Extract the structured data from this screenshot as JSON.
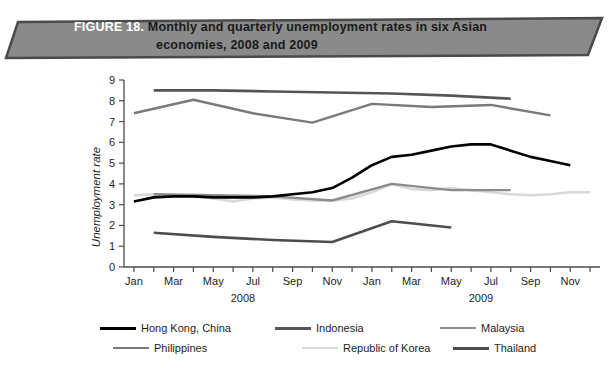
{
  "banner": {
    "figure_label": "FIGURE 18.",
    "title_line1": "Monthly and quarterly unemployment rates in six Asian",
    "title_line2": "economies, 2008 and 2009",
    "fill_color": "#8a8a8a",
    "border_color": "#4a4a4a",
    "label_color": "#ffffff",
    "title_color": "#1a1a1a"
  },
  "chart_data": {
    "type": "line",
    "title": "Monthly and quarterly unemployment rates in six Asian economies, 2008 and 2009",
    "xlabel": "",
    "ylabel": "Unemployment rate",
    "ylim": [
      0,
      9
    ],
    "yticks": [
      0,
      1,
      2,
      3,
      4,
      5,
      6,
      7,
      8,
      9
    ],
    "ytick_labels": [
      "0",
      "1",
      "2",
      "3",
      "4",
      "5",
      "6",
      "7",
      "8",
      "9"
    ],
    "grid": false,
    "legend_position": "below",
    "x": [
      "Jan 2008",
      "Feb 2008",
      "Mar 2008",
      "Apr 2008",
      "May 2008",
      "Jun 2008",
      "Jul 2008",
      "Aug 2008",
      "Sep 2008",
      "Oct 2008",
      "Nov 2008",
      "Dec 2008",
      "Jan 2009",
      "Feb 2009",
      "Mar 2009",
      "Apr 2009",
      "May 2009",
      "Jun 2009",
      "Jul 2009",
      "Aug 2009",
      "Sep 2009",
      "Oct 2009",
      "Nov 2009",
      "Dec 2009"
    ],
    "xtick_labels": [
      "Jan",
      "",
      "Mar",
      "",
      "May",
      "",
      "Jul",
      "",
      "Sep",
      "",
      "Nov",
      "",
      "Jan",
      "",
      "Mar",
      "",
      "May",
      "",
      "Jul",
      "",
      "Sep",
      "",
      "Nov",
      ""
    ],
    "xgroups": [
      {
        "label": "2008",
        "start": 0,
        "end": 11
      },
      {
        "label": "2009",
        "start": 12,
        "end": 23
      }
    ],
    "series": [
      {
        "name": "Hong Kong, China",
        "color": "#000000",
        "width": 2.6,
        "x": [
          0,
          1,
          2,
          3,
          4,
          5,
          6,
          7,
          8,
          9,
          10,
          11,
          12,
          13,
          14,
          15,
          16,
          17,
          18,
          19,
          20,
          21,
          22
        ],
        "values": [
          3.15,
          3.35,
          3.4,
          3.4,
          3.35,
          3.35,
          3.35,
          3.4,
          3.5,
          3.6,
          3.8,
          4.3,
          4.9,
          5.3,
          5.4,
          5.6,
          5.8,
          5.9,
          5.9,
          5.6,
          5.3,
          5.1,
          4.9
        ]
      },
      {
        "name": "Indonesia",
        "color": "#555555",
        "width": 2.6,
        "x": [
          1,
          4,
          7,
          10,
          13,
          16,
          19
        ],
        "values": [
          8.5,
          8.5,
          8.45,
          8.4,
          8.35,
          8.25,
          8.1
        ]
      },
      {
        "name": "Malaysia",
        "color": "#8c8c8c",
        "width": 2.4,
        "x": [
          1,
          4,
          7,
          10,
          13,
          16,
          19
        ],
        "values": [
          3.5,
          3.45,
          3.4,
          3.2,
          4.0,
          3.7,
          3.7
        ]
      },
      {
        "name": "Philippines",
        "color": "#7a7a7a",
        "width": 2.4,
        "x": [
          0,
          3,
          6,
          9,
          12,
          15,
          18,
          21
        ],
        "values": [
          7.4,
          8.05,
          7.4,
          6.95,
          7.85,
          7.7,
          7.8,
          7.3
        ]
      },
      {
        "name": "Republic of Korea",
        "color": "#d9d9d9",
        "width": 2.6,
        "x": [
          0,
          1,
          2,
          3,
          4,
          5,
          6,
          7,
          8,
          9,
          10,
          11,
          12,
          13,
          14,
          15,
          16,
          17,
          18,
          19,
          20,
          21,
          22,
          23
        ],
        "values": [
          3.45,
          3.5,
          3.45,
          3.4,
          3.3,
          3.15,
          3.3,
          3.35,
          3.25,
          3.2,
          3.2,
          3.3,
          3.6,
          4.0,
          3.75,
          3.7,
          3.8,
          3.7,
          3.6,
          3.5,
          3.45,
          3.5,
          3.6,
          3.6
        ]
      },
      {
        "name": "Thailand",
        "color": "#4d4d4d",
        "width": 2.6,
        "x": [
          1,
          4,
          7,
          10,
          13,
          16
        ],
        "values": [
          1.65,
          1.45,
          1.3,
          1.2,
          2.2,
          1.9
        ]
      }
    ]
  },
  "legend": {
    "row1": [
      {
        "name": "Hong Kong, China",
        "color": "#000000",
        "width": 3
      },
      {
        "name": "Indonesia",
        "color": "#555555",
        "width": 3
      },
      {
        "name": "Malaysia",
        "color": "#8c8c8c",
        "width": 2.5
      }
    ],
    "row2": [
      {
        "name": "Philippines",
        "color": "#7a7a7a",
        "width": 2.5
      },
      {
        "name": "Republic of Korea",
        "color": "#d9d9d9",
        "width": 2.5
      },
      {
        "name": "Thailand",
        "color": "#4d4d4d",
        "width": 3
      }
    ]
  }
}
